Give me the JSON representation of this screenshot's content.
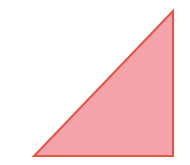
{
  "diagram": {
    "shape": "right-triangle",
    "vertices": {
      "top": [
        173,
        11
      ],
      "bottom_left": [
        34,
        156
      ],
      "bottom_right": [
        173,
        156
      ]
    },
    "colors": {
      "fill": "#F4A3AB",
      "stroke": "#E8533F",
      "background": "#FFFFFF"
    },
    "stroke_width": 2
  }
}
